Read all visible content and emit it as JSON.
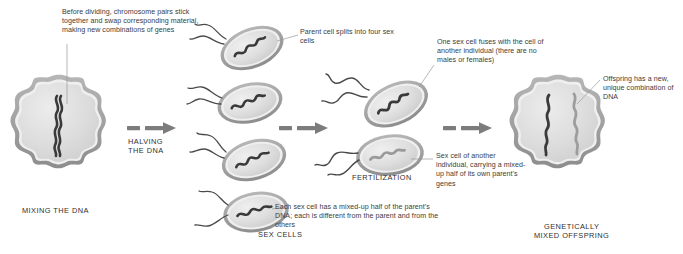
{
  "diagram": {
    "background_color": "#ffffff",
    "cell_fill": "#d8d8d8",
    "cell_membrane": "#8e8e8e",
    "chromosome_dark": "#3a3a3a",
    "chromosome_light": "#9a9a9a",
    "arrow_color": "#7c7c7c",
    "leader_color": "#8a8a8a",
    "text_color": "#3c3c3c"
  },
  "captions": {
    "before_dividing": "Before dividing, chromosome pairs stick together and swap corresponding material, making new combinations of genes",
    "parent_splits": "Parent cell splits into four sex cells",
    "one_sex_cell_fuses": "One sex cell fuses with the cell of another individual (there are no males or females)",
    "offspring_dna": "Offspring has a new, unique combination of DNA",
    "each_sex_cell": "Each sex cell has a mixed-up half of the parent's DNA; each is different from the parent and from the others",
    "sex_cell_of_another": "Sex cell of another individual, carrying a mixed-up half of its own parent's genes"
  },
  "stage_labels": {
    "mixing": "MIXING THE DNA",
    "halving": "HALVING\nTHE DNA",
    "fertilization": "FERTILIZATION",
    "sex_cells": "SEX CELLS",
    "offspring": "GENETICALLY\nMIXED OFFSPRING"
  },
  "elements": {
    "parent_cell": "parent cell with paired chromosome",
    "sex_cells_count": 4,
    "fusing_cells_count": 2,
    "offspring_chromosomes": 2,
    "arrows": [
      {
        "name": "arrow-halving",
        "label": "HALVING THE DNA"
      },
      {
        "name": "arrow-to-fertilization",
        "label": ""
      },
      {
        "name": "arrow-to-offspring",
        "label": ""
      }
    ]
  }
}
